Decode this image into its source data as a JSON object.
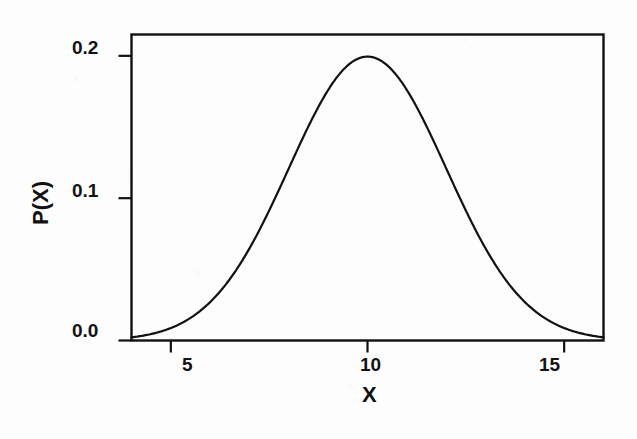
{
  "figure": {
    "background_color": "#fdfdfd",
    "ink_color": "#111111",
    "width": 637,
    "height": 439
  },
  "axes": {
    "x_title": "X",
    "y_title": "P(X)",
    "x_ticks": [
      {
        "label": "5",
        "value": 5
      },
      {
        "label": "10",
        "value": 10
      },
      {
        "label": "15",
        "value": 15
      }
    ],
    "y_ticks": [
      {
        "label": "0.0",
        "value": 0.0
      },
      {
        "label": "0.1",
        "value": 0.1
      },
      {
        "label": "0.2",
        "value": 0.2
      }
    ]
  },
  "chart_data": {
    "type": "line",
    "title": "",
    "subtitle": "",
    "xlabel": "X",
    "ylabel": "P(X)",
    "xlim": [
      4,
      16
    ],
    "ylim": [
      0.0,
      0.215
    ],
    "grid": false,
    "legend": false,
    "legend_position": "none",
    "annotations": [],
    "distribution": {
      "family": "normal",
      "mean": 10,
      "sigma": 2,
      "peak_value": 0.1995,
      "peak_x": 10
    },
    "series": [
      {
        "name": "P(X)",
        "color": "#111111",
        "line_width": 2.2,
        "x": [
          4.0,
          4.25,
          4.5,
          4.75,
          5.0,
          5.25,
          5.5,
          5.75,
          6.0,
          6.25,
          6.5,
          6.75,
          7.0,
          7.25,
          7.5,
          7.75,
          8.0,
          8.25,
          8.5,
          8.75,
          9.0,
          9.25,
          9.5,
          9.75,
          10.0,
          10.25,
          10.5,
          10.75,
          11.0,
          11.25,
          11.5,
          11.75,
          12.0,
          12.25,
          12.5,
          12.75,
          13.0,
          13.25,
          13.5,
          13.75,
          14.0,
          14.25,
          14.5,
          14.75,
          15.0,
          15.25,
          15.5,
          15.75,
          16.0
        ],
        "y": [
          0.0022,
          0.0032,
          0.0045,
          0.0062,
          0.0088,
          0.0121,
          0.0163,
          0.0216,
          0.027,
          0.0344,
          0.043,
          0.0529,
          0.0648,
          0.077,
          0.0912,
          0.1057,
          0.121,
          0.1354,
          0.1497,
          0.1628,
          0.176,
          0.1847,
          0.1917,
          0.1965,
          0.1995,
          0.1965,
          0.1917,
          0.1847,
          0.176,
          0.1628,
          0.1497,
          0.1354,
          0.121,
          0.1057,
          0.0912,
          0.077,
          0.0648,
          0.0529,
          0.043,
          0.0344,
          0.027,
          0.0216,
          0.0163,
          0.0121,
          0.0088,
          0.0062,
          0.0045,
          0.0032,
          0.0022
        ]
      }
    ]
  }
}
